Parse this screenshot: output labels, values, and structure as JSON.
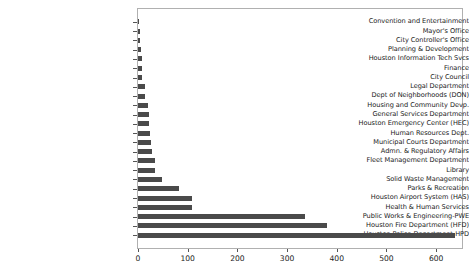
{
  "chart_data": {
    "type": "bar",
    "orientation": "horizontal",
    "title": "",
    "xlabel": "",
    "ylabel": "",
    "xlim": [
      0,
      652
    ],
    "ylim": [
      0,
      26
    ],
    "grid": false,
    "legend": null,
    "bar_color": "#4a4a4a",
    "frame_color": "#b0b0b0",
    "xticks": [
      0,
      100,
      200,
      300,
      400,
      500,
      600
    ],
    "xticklabels": [
      "0",
      "100",
      "200",
      "300",
      "400",
      "500",
      "600"
    ],
    "categories": [
      "Convention and Entertainment",
      "Mayor's Office",
      "City Controller's Office",
      "Planning & Development",
      "Houston Information Tech Svcs",
      "Finance",
      "City Council",
      "Legal Department",
      "Dept of Neighborhoods (DON)",
      "Housing and Community Devp.",
      "General Services Department",
      "Houston Emergency Center (HEC)",
      "Human Resources Dept.",
      "Municipal Courts Department",
      "Admn. & Regulatory Affairs",
      "Fleet Management Department",
      "Library",
      "Solid Waste Management",
      "Parks & Recreation",
      "Houston Airport System (HAS)",
      "Health & Human Services",
      "Public Works & Engineering-PWE",
      "Houston Fire Department (HFD)",
      "Houston Police Department-HPD"
    ],
    "values": [
      1,
      5,
      5,
      6,
      8,
      8,
      9,
      14,
      15,
      21,
      22,
      22,
      24,
      26,
      28,
      34,
      35,
      48,
      82,
      108,
      109,
      337,
      380,
      637
    ]
  }
}
